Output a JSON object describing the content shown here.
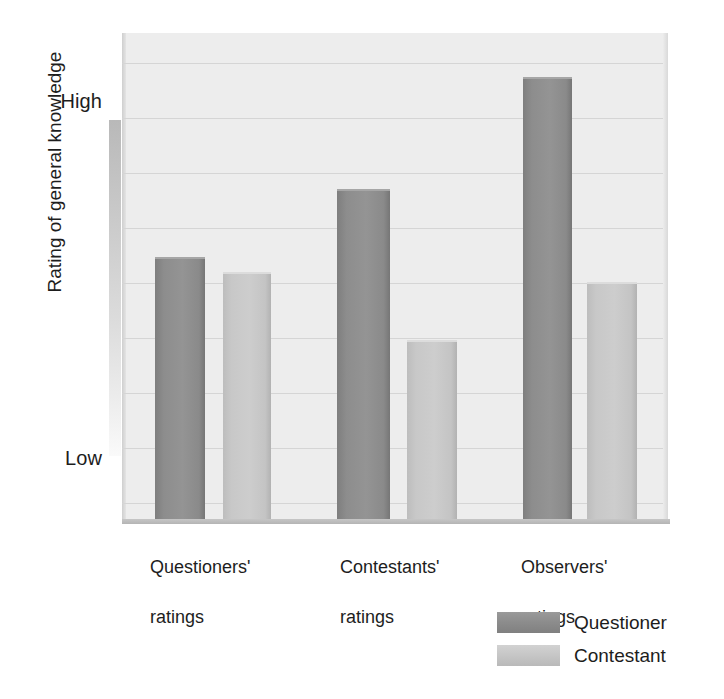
{
  "chart_data": {
    "type": "bar",
    "title": "",
    "xlabel": "",
    "ylabel": "Rating of general knowledge",
    "categories": [
      "Questioners'\nratings",
      "Contestants'\nratings",
      "Observers'\nratings"
    ],
    "series": [
      {
        "name": "Questioner",
        "color": "#8d8d8d",
        "values": [
          54,
          68,
          91
        ]
      },
      {
        "name": "Contestant",
        "color": "#c7c7c7",
        "values": [
          51,
          37,
          49
        ]
      }
    ],
    "ytick_labels": {
      "high": "High",
      "low": "Low"
    },
    "ylim": [
      0,
      100
    ],
    "y_axis_note": "Ordinal scale: only Low and High endpoints labelled",
    "grid": true,
    "gridline_count": 9,
    "legend_position": "bottom-right",
    "plot_background": "#ededed",
    "gridline_color": "#d5d5d5"
  },
  "y_axis": {
    "title": "Rating of general knowledge",
    "high_label": "High",
    "low_label": "Low",
    "gradient_top_color": "#b9b9b9",
    "gradient_bottom_color": "#fafafa"
  },
  "x_axis": {
    "categories": [
      {
        "line1": "Questioners'",
        "line2": "ratings"
      },
      {
        "line1": "Contestants'",
        "line2": "ratings"
      },
      {
        "line1": "Observers'",
        "line2": "ratings"
      }
    ]
  },
  "legend": {
    "items": [
      {
        "label": "Questioner",
        "swatch": "questioner-swatch",
        "color": "#8d8d8d"
      },
      {
        "label": "Contestant",
        "swatch": "contestant-swatch",
        "color": "#c7c7c7"
      }
    ]
  }
}
